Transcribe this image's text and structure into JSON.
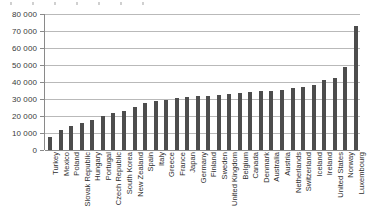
{
  "chart_data": {
    "type": "bar",
    "title": "",
    "subtitle": "",
    "xlabel": "",
    "ylabel": "",
    "ylim": [
      0,
      80000
    ],
    "ytick_step": 10000,
    "grid": true,
    "legend": false,
    "legend_position": "none",
    "orientation": "vertical",
    "bar_color": "#4d4d4d",
    "gridline_color": "#b9b9b9",
    "axis_color": "#8a8a8a",
    "xtick_rotation": -90,
    "ytick_labels": [
      "0",
      "10 000",
      "20 000",
      "30 000",
      "40 000",
      "50 000",
      "60 000",
      "70 000",
      "80 000"
    ],
    "ytick_values": [
      0,
      10000,
      20000,
      30000,
      40000,
      50000,
      60000,
      70000,
      80000
    ],
    "categories": [
      "Turkey",
      "Mexico",
      "Poland",
      "Slovak Republic",
      "Hungary",
      "Portugal",
      "Czech Republic",
      "South Korea",
      "New Zealand",
      "Spain",
      "Italy",
      "Greece",
      "France",
      "Japan",
      "Germany",
      "Finland",
      "Sweden",
      "United Kingdom",
      "Belgium",
      "Canada",
      "Denmark",
      "Australia",
      "Austria",
      "Netherlands",
      "Switzerland",
      "Iceland",
      "Ireland",
      "United States",
      "Norway",
      "Luxembourg"
    ],
    "values": [
      7500,
      11500,
      14000,
      16000,
      17500,
      20000,
      21500,
      23000,
      25500,
      27500,
      29000,
      29500,
      30500,
      31000,
      31500,
      32000,
      32500,
      33000,
      33500,
      34000,
      34500,
      35000,
      35500,
      36500,
      37000,
      38000,
      41000,
      42500,
      49000,
      73000
    ]
  }
}
